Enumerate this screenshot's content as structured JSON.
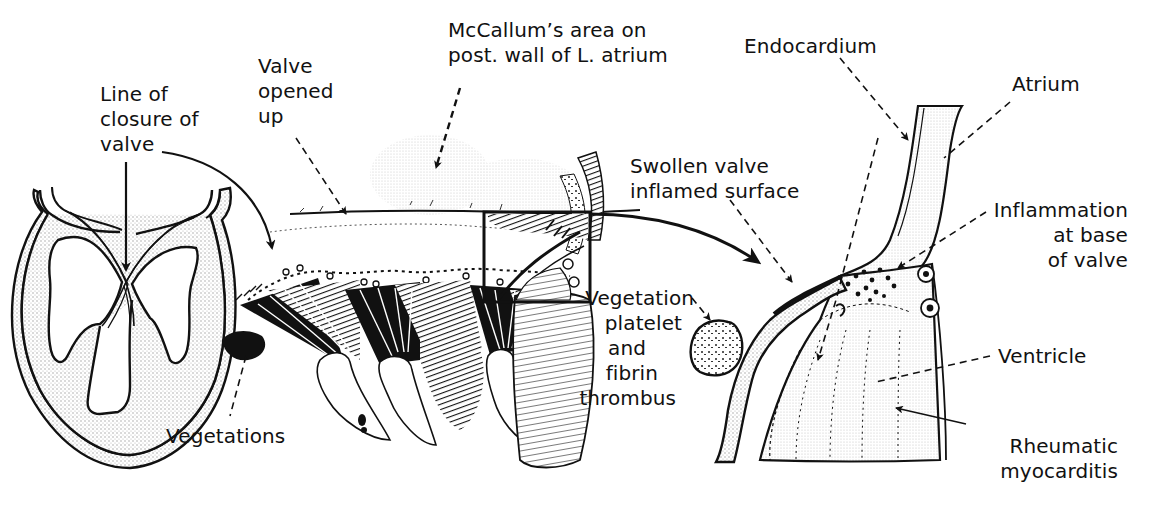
{
  "figure": {
    "panels": [
      {
        "id": "heart-section",
        "description": "Longitudinal section of heart showing line of closure of mitral valve"
      },
      {
        "id": "valve-opened",
        "description": "Mitral valve opened up showing vegetations along line of closure"
      },
      {
        "id": "magnified-valve",
        "description": "Magnified section of valve base with atrium and ventricle"
      }
    ],
    "labels": {
      "line_of_closure": [
        "Line of",
        "closure of",
        "valve"
      ],
      "valve_opened": [
        "Valve",
        "opened",
        "up"
      ],
      "mccallum": [
        "McCallum’s area on",
        "post. wall of L. atrium"
      ],
      "endocardium": "Endocardium",
      "atrium": "Atrium",
      "swollen_valve": [
        "Swollen valve",
        "inflamed surface"
      ],
      "inflammation": [
        "Inflammation",
        "at base",
        "of valve"
      ],
      "vegetation_thrombus": [
        "Vegetation",
        "platelet",
        "and",
        "fibrin",
        "thrombus"
      ],
      "ventricle": "Ventricle",
      "rheumatic_myocarditis": [
        "Rheumatic",
        "myocarditis"
      ],
      "vegetations": "Vegetations"
    },
    "colors": {
      "ink": "#111111",
      "stipple": "#bdbdbd",
      "background": "#ffffff"
    }
  }
}
